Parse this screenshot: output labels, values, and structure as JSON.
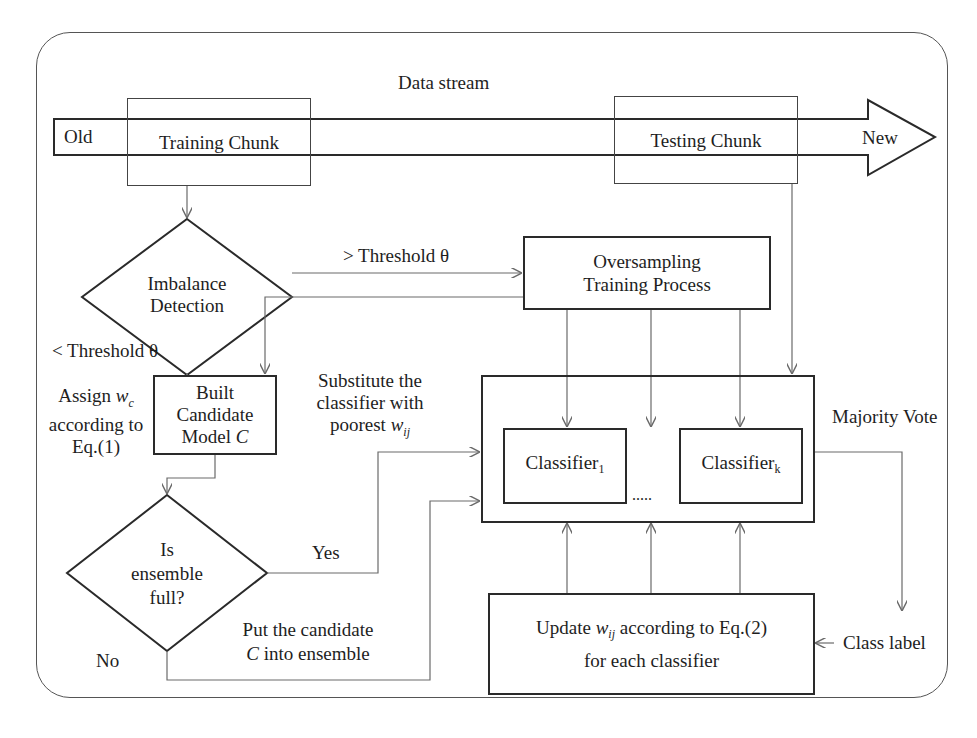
{
  "diagram": {
    "title": "Data stream",
    "stream": {
      "start_label": "Old",
      "end_label": "New",
      "training_chunk": "Training Chunk",
      "testing_chunk": "Testing Chunk"
    },
    "nodes": {
      "imbalance_detection": {
        "line1": "Imbalance",
        "line2": "Detection",
        "shape": "diamond"
      },
      "oversampling": {
        "line1": "Oversampling",
        "line2": "Training Process",
        "shape": "rectangle"
      },
      "built_candidate": {
        "line1": "Built",
        "line2": "Candidate",
        "line3_prefix": "Model ",
        "line3_var": "C",
        "shape": "rectangle"
      },
      "ensemble_full": {
        "line1": "Is",
        "line2": "ensemble",
        "line3": "full?",
        "shape": "diamond"
      },
      "ensemble": {
        "classifier_first": "Classifier",
        "classifier_first_sub": "1",
        "ellipsis": ".....",
        "classifier_last": "Classifier",
        "classifier_last_sub": "k",
        "shape": "rectangle"
      },
      "update_weights": {
        "line1_prefix": "Update ",
        "line1_var": "w",
        "line1_sub": "ij",
        "line1_suffix": " according to Eq.(2)",
        "line2": "for each classifier",
        "shape": "rectangle"
      }
    },
    "edge_labels": {
      "above_threshold": "> Threshold θ",
      "below_threshold": "< Threshold θ",
      "assign_weight_prefix": "Assign ",
      "assign_weight_var": "w",
      "assign_weight_sub": "c",
      "assign_weight_line2": "according to",
      "assign_weight_line3": "Eq.(1)",
      "substitute_line1": "Substitute the",
      "substitute_line2": "classifier with",
      "substitute_line3_prefix": "poorest ",
      "substitute_line3_var": "w",
      "substitute_line3_sub": "ij",
      "yes": "Yes",
      "no": "No",
      "put_candidate_line1": "Put the candidate",
      "put_candidate_line2_var": "C",
      "put_candidate_line2_suffix": " into ensemble",
      "majority_vote": "Majority Vote",
      "class_label": "Class label"
    },
    "colors": {
      "stroke_dark": "#2a2a2a",
      "stroke_connector": "#6a6a6a",
      "background": "#ffffff",
      "text": "#1e1e1e"
    }
  }
}
